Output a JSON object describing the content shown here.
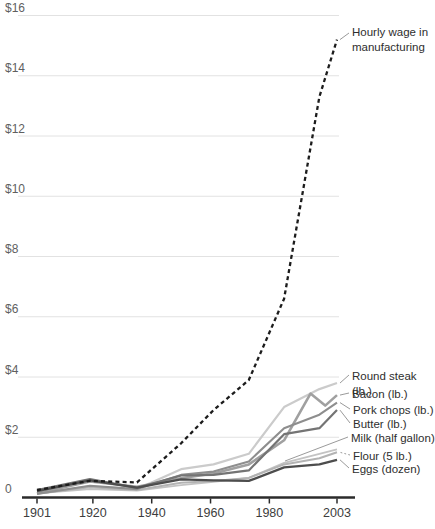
{
  "chart_data": {
    "type": "line",
    "title": "",
    "xlabel": "",
    "ylabel": "",
    "ylim": [
      0,
      16
    ],
    "xlim": [
      1901,
      2003
    ],
    "grid": true,
    "legend_position": "right-annotations",
    "currency_unit": "$",
    "x_axis": {
      "ticks": [
        {
          "label": "1901",
          "year": 1901
        },
        {
          "label": "1920",
          "year": 1920
        },
        {
          "label": "1940",
          "year": 1940
        },
        {
          "label": "1960",
          "year": 1960
        },
        {
          "label": "1980",
          "year": 1980
        },
        {
          "label": "2003",
          "year": 2003
        }
      ]
    },
    "y_axis": {
      "ticks": [
        {
          "label": "$16",
          "value": 16
        },
        {
          "label": "$14",
          "value": 14
        },
        {
          "label": "$12",
          "value": 12
        },
        {
          "label": "$10",
          "value": 10
        },
        {
          "label": "$8",
          "value": 8
        },
        {
          "label": "$6",
          "value": 6
        },
        {
          "label": "$4",
          "value": 4
        },
        {
          "label": "$2",
          "value": 2
        },
        {
          "label": "0",
          "value": 0
        }
      ]
    },
    "series": [
      {
        "name": "Round steak (lb.)",
        "color": "#cbcbcb",
        "width": 2.2,
        "dash": "",
        "x": [
          1901,
          1919,
          1935,
          1950,
          1961,
          1973,
          1985,
          1997,
          2003
        ],
        "y": [
          0.13,
          0.37,
          0.28,
          0.94,
          1.1,
          1.45,
          3.0,
          3.6,
          3.8
        ]
      },
      {
        "name": "Milk (half gallon)",
        "color": "#c3c3c3",
        "width": 1.8,
        "dash": "",
        "x": [
          1901,
          1919,
          1935,
          1950,
          1961,
          1973,
          1985,
          1997,
          2003
        ],
        "y": [
          0.14,
          0.28,
          0.23,
          0.41,
          0.52,
          0.65,
          1.15,
          1.45,
          1.6
        ]
      },
      {
        "name": "Flour (5 lb.)",
        "color": "#b3b3b3",
        "width": 2.0,
        "dash": "",
        "x": [
          1901,
          1919,
          1935,
          1950,
          1961,
          1973,
          1985,
          1997,
          2003
        ],
        "y": [
          0.13,
          0.34,
          0.25,
          0.49,
          0.55,
          0.65,
          1.1,
          1.3,
          1.5
        ]
      },
      {
        "name": "Bacon (lb.)",
        "color": "#a0a0a0",
        "width": 2.6,
        "dash": "",
        "x": [
          1901,
          1919,
          1935,
          1950,
          1961,
          1973,
          1985,
          1994,
          1999,
          2003
        ],
        "y": [
          0.14,
          0.53,
          0.36,
          0.64,
          0.8,
          1.1,
          1.9,
          3.45,
          3.05,
          3.4
        ]
      },
      {
        "name": "Pork chops (lb.)",
        "color": "#8e8e8e",
        "width": 2.1,
        "dash": "",
        "x": [
          1901,
          1919,
          1935,
          1950,
          1961,
          1973,
          1985,
          1997,
          2003
        ],
        "y": [
          0.12,
          0.39,
          0.28,
          0.75,
          0.86,
          1.2,
          2.3,
          2.75,
          3.15
        ]
      },
      {
        "name": "Butter (lb.)",
        "color": "#747474",
        "width": 2.2,
        "dash": "",
        "x": [
          1901,
          1919,
          1935,
          1950,
          1961,
          1973,
          1985,
          1997,
          2003
        ],
        "y": [
          0.25,
          0.61,
          0.32,
          0.73,
          0.75,
          0.9,
          2.1,
          2.3,
          2.9
        ]
      },
      {
        "name": "Eggs (dozen)",
        "color": "#4d4d4d",
        "width": 2.3,
        "dash": "",
        "x": [
          1901,
          1919,
          1935,
          1950,
          1961,
          1973,
          1985,
          1997,
          2003
        ],
        "y": [
          0.21,
          0.57,
          0.33,
          0.6,
          0.57,
          0.55,
          1.0,
          1.1,
          1.25
        ]
      },
      {
        "name": "Hourly wage in\nmanufacturing",
        "color": "#1c1c1c",
        "width": 2.3,
        "dash": "4 3.2",
        "x": [
          1901,
          1919,
          1935,
          1950,
          1961,
          1973,
          1985,
          1997,
          2003
        ],
        "y": [
          0.25,
          0.55,
          0.5,
          1.8,
          2.9,
          3.9,
          6.6,
          13.3,
          15.2
        ]
      }
    ]
  }
}
